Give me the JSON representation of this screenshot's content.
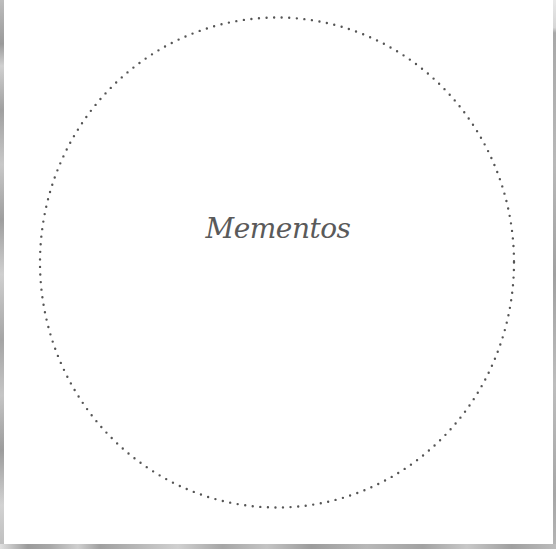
{
  "label": {
    "title": "Mementos"
  },
  "colors": {
    "background": "#ffffff",
    "dots": "#555555",
    "title": "#5a5a5a"
  },
  "frame": {
    "shape": "dotted-circle"
  }
}
